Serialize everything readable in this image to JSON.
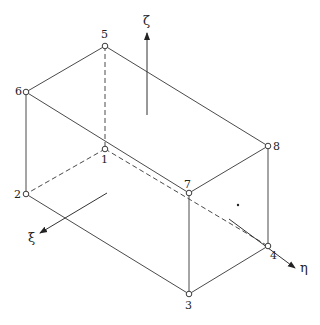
{
  "diagram": {
    "nodes": [
      {
        "id": "1",
        "label": "1"
      },
      {
        "id": "2",
        "label": "2"
      },
      {
        "id": "3",
        "label": "3"
      },
      {
        "id": "4",
        "label": "4"
      },
      {
        "id": "5",
        "label": "5"
      },
      {
        "id": "6",
        "label": "6"
      },
      {
        "id": "7",
        "label": "7"
      },
      {
        "id": "8",
        "label": "8"
      }
    ],
    "axes": {
      "xi": "ξ",
      "eta": "η",
      "zeta": "ζ"
    }
  }
}
